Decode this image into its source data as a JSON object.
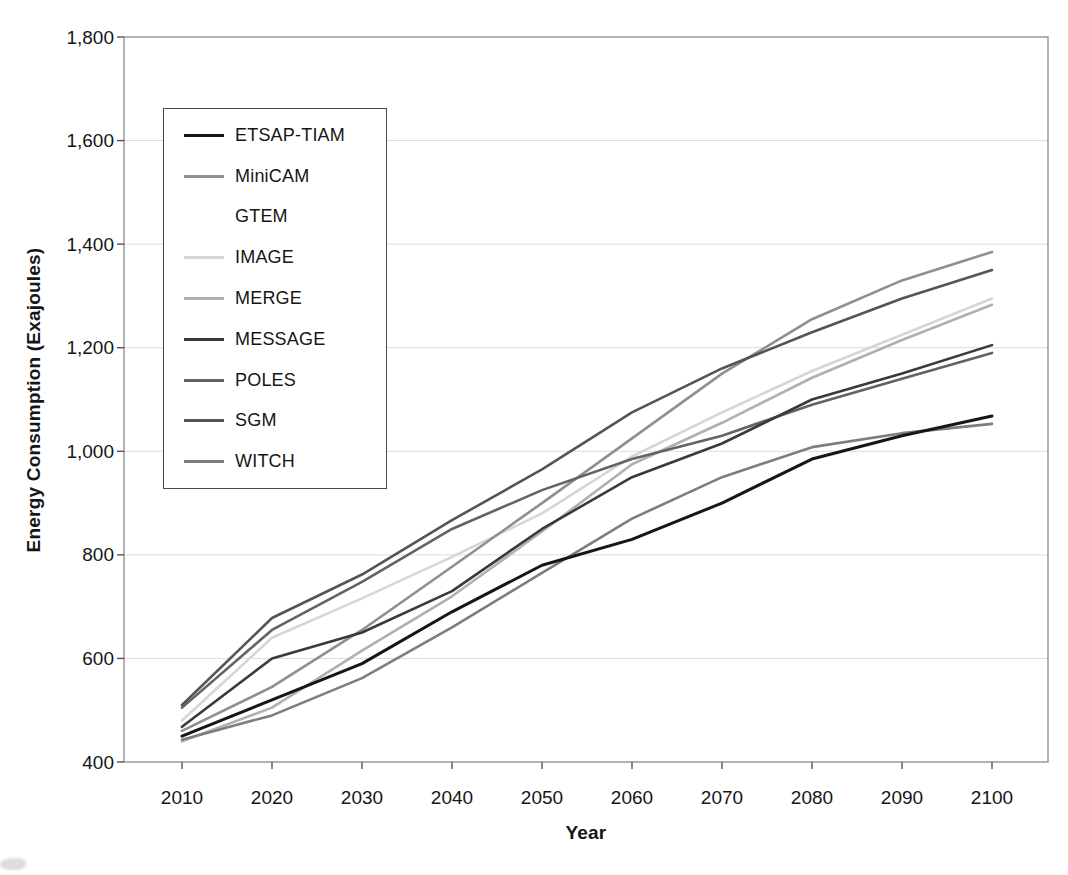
{
  "chart_data": {
    "type": "line",
    "title": "",
    "xlabel": "Year",
    "ylabel": "Energy Consumption (Exajoules)",
    "x_ticks": [
      2010,
      2020,
      2030,
      2040,
      2050,
      2060,
      2070,
      2080,
      2090,
      2100
    ],
    "x_tick_labels": [
      "2010",
      "2020",
      "2030",
      "2040",
      "2050",
      "2060",
      "2070",
      "2080",
      "2090",
      "2100"
    ],
    "y_ticks": [
      400,
      600,
      800,
      1000,
      1200,
      1400,
      1600,
      1800
    ],
    "y_tick_labels": [
      "400",
      "600",
      "800",
      "1,000",
      "1,200",
      "1,400",
      "1,600",
      "1,800"
    ],
    "ylim": [
      400,
      1800
    ],
    "grid": "horizontal",
    "grid_color": "#dcdcdc",
    "frame_color": "#8a8a8a",
    "legend_position": "upper-left-inside",
    "series": [
      {
        "name": "ETSAP-TIAM",
        "color": "#161616",
        "values": [
          450,
          520,
          590,
          690,
          780,
          830,
          900,
          985,
          1030,
          1068
        ]
      },
      {
        "name": "MiniCAM",
        "color": "#8f8f8f",
        "values": [
          460,
          545,
          655,
          777,
          900,
          1025,
          1150,
          1255,
          1330,
          1385
        ]
      },
      {
        "name": "GTEM",
        "color": "#ffffff",
        "values": []
      },
      {
        "name": "IMAGE",
        "color": "#d6d6d6",
        "values": [
          480,
          640,
          716,
          796,
          880,
          990,
          1075,
          1155,
          1225,
          1295
        ]
      },
      {
        "name": "MERGE",
        "color": "#b0b0b0",
        "values": [
          440,
          505,
          615,
          720,
          845,
          975,
          1055,
          1142,
          1215,
          1283
        ]
      },
      {
        "name": "MESSAGE",
        "color": "#3a3a3a",
        "values": [
          468,
          600,
          650,
          730,
          850,
          950,
          1015,
          1100,
          1150,
          1205
        ]
      },
      {
        "name": "POLES",
        "color": "#636363",
        "values": [
          505,
          655,
          748,
          850,
          925,
          985,
          1030,
          1090,
          1140,
          1190
        ]
      },
      {
        "name": "SGM",
        "color": "#555555",
        "values": [
          510,
          678,
          762,
          867,
          965,
          1075,
          1160,
          1230,
          1295,
          1350
        ]
      },
      {
        "name": "WITCH",
        "color": "#7d7d7d",
        "values": [
          443,
          490,
          562,
          660,
          765,
          870,
          950,
          1008,
          1035,
          1053
        ]
      }
    ],
    "draw_order": [
      "IMAGE",
      "MERGE",
      "WITCH",
      "MiniCAM",
      "POLES",
      "SGM",
      "MESSAGE",
      "ETSAP-TIAM"
    ]
  }
}
